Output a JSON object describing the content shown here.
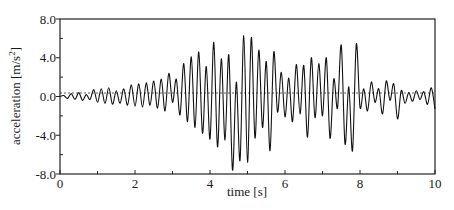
{
  "chart_data": {
    "type": "line",
    "title": "",
    "xlabel": "time [s]",
    "ylabel": "acceleration [m/s²]",
    "ylabel_main": "acceleration [m/s",
    "ylabel_sup": "2",
    "ylabel_end": "]",
    "xlim": [
      0,
      10
    ],
    "ylim": [
      -8.0,
      8.0
    ],
    "x_ticks": [
      0,
      2,
      4,
      6,
      8,
      10
    ],
    "x_tick_labels": [
      "0",
      "2",
      "4",
      "6",
      "8",
      "10"
    ],
    "x_minor_ticks": [
      1,
      3,
      5,
      7,
      9
    ],
    "y_ticks": [
      -8.0,
      -4.0,
      0.0,
      4.0,
      8.0
    ],
    "y_tick_labels": [
      "-8.0",
      "-4.0",
      "0.0",
      "4.0",
      "8.0"
    ],
    "y_minor_ticks": [
      -6.0,
      -2.0,
      2.0,
      6.0
    ],
    "grid": false,
    "zero_line": "dashed",
    "legend": null,
    "series": [
      {
        "name": "acceleration",
        "x": [
          0.0,
          0.1,
          0.2,
          0.3,
          0.4,
          0.5,
          0.6,
          0.7,
          0.8,
          0.9,
          1.0,
          1.1,
          1.2,
          1.3,
          1.4,
          1.5,
          1.6,
          1.7,
          1.8,
          1.9,
          2.0,
          2.1,
          2.2,
          2.3,
          2.4,
          2.5,
          2.6,
          2.7,
          2.8,
          2.9,
          3.0,
          3.1,
          3.2,
          3.3,
          3.4,
          3.5,
          3.6,
          3.7,
          3.8,
          3.9,
          4.0,
          4.1,
          4.2,
          4.3,
          4.4,
          4.5,
          4.6,
          4.7,
          4.8,
          4.9,
          5.0,
          5.1,
          5.2,
          5.3,
          5.4,
          5.5,
          5.6,
          5.7,
          5.8,
          5.9,
          6.0,
          6.1,
          6.2,
          6.3,
          6.4,
          6.5,
          6.6,
          6.7,
          6.8,
          6.9,
          7.0,
          7.1,
          7.2,
          7.3,
          7.4,
          7.5,
          7.6,
          7.7,
          7.8,
          7.9,
          8.0,
          8.1,
          8.2,
          8.3,
          8.4,
          8.5,
          8.6,
          8.7,
          8.8,
          8.9,
          9.0,
          9.1,
          9.2,
          9.3,
          9.4,
          9.5,
          9.6,
          9.7,
          9.8,
          9.9,
          10.0
        ],
        "values": [
          0.0,
          0.1,
          -0.2,
          0.3,
          -0.3,
          0.4,
          -0.4,
          0.2,
          -0.3,
          0.7,
          -0.6,
          0.8,
          -0.7,
          0.9,
          -0.8,
          0.6,
          -0.7,
          0.8,
          -0.9,
          1.2,
          -1.0,
          1.3,
          -1.1,
          1.4,
          -0.9,
          1.6,
          -1.2,
          1.8,
          -1.5,
          2.4,
          -0.6,
          1.8,
          -1.9,
          3.4,
          -2.6,
          4.1,
          -3.2,
          4.6,
          -3.8,
          3.1,
          -4.4,
          5.6,
          -5.2,
          3.9,
          -4.5,
          4.3,
          -7.6,
          1.5,
          -6.6,
          6.3,
          -6.8,
          6.1,
          -4.3,
          4.8,
          -3.2,
          3.6,
          -5.6,
          4.6,
          -1.6,
          2.5,
          -2.1,
          1.9,
          -2.6,
          3.3,
          -1.8,
          3.2,
          -4.2,
          4.0,
          -2.2,
          3.4,
          -2.0,
          4.0,
          -4.3,
          1.8,
          -1.2,
          5.3,
          -4.9,
          1.0,
          -5.6,
          5.4,
          -1.1,
          0.8,
          -1.5,
          1.5,
          -0.6,
          0.8,
          -1.8,
          1.6,
          -0.4,
          1.3,
          -2.3,
          0.6,
          -0.7,
          0.4,
          -0.5,
          0.6,
          -0.3,
          0.5,
          -0.8,
          0.9,
          -1.3
        ]
      }
    ]
  }
}
